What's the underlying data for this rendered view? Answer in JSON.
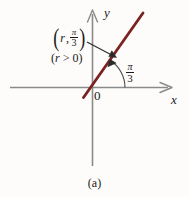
{
  "figure": {
    "caption": "(a)",
    "background_color": "#fdfcfa",
    "axes": {
      "x_label": "x",
      "y_label": "y",
      "origin_label": "0",
      "axis_color": "#8a8a8a"
    },
    "ray": {
      "color": "#7a2222",
      "description": "terminal ray at angle pi/3 from positive x-axis"
    },
    "point_label": {
      "open_paren": "(",
      "r_symbol": "r",
      "comma": ",",
      "angle_numerator": "π",
      "angle_denominator": "3",
      "close_paren": ")"
    },
    "condition_label": {
      "open_paren": "(",
      "r_symbol": "r",
      "relation": ">",
      "value": "0",
      "close_paren": ")"
    },
    "angle_label": {
      "numerator": "π",
      "denominator": "3"
    }
  }
}
